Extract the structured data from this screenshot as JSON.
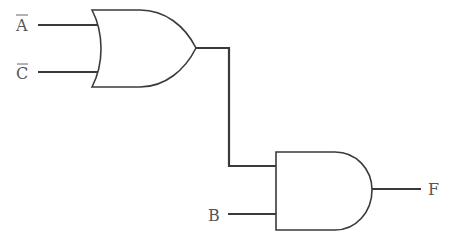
{
  "diagram": {
    "type": "logic-circuit",
    "colors": {
      "line": "#3a3a3a",
      "label": "#555555",
      "background": "#ffffff"
    },
    "inputs": [
      {
        "id": "A_bar",
        "label": "A",
        "negated": true
      },
      {
        "id": "C_bar",
        "label": "C",
        "negated": true
      },
      {
        "id": "B",
        "label": "B",
        "negated": false
      }
    ],
    "gates": [
      {
        "id": "or1",
        "type": "OR",
        "inputs": [
          "A_bar",
          "C_bar"
        ]
      },
      {
        "id": "and1",
        "type": "AND",
        "inputs": [
          "or1",
          "B"
        ]
      }
    ],
    "output": {
      "id": "F",
      "label": "F",
      "source": "and1"
    }
  }
}
